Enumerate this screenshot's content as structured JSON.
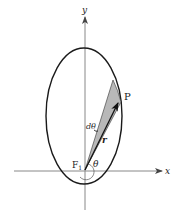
{
  "diagram": {
    "labels": {
      "y_axis": "y",
      "x_axis": "x",
      "point": "P",
      "focus": "F",
      "focus_subscript": "1",
      "angle": "θ",
      "dtheta": "dθ",
      "radius": "r"
    },
    "colors": {
      "axis": "#888888",
      "ellipse": "#1a1a1a",
      "wedge_fill": "#b8b8b8",
      "vector": "#111111"
    },
    "geometry": {
      "ellipse_center": [
        84,
        116
      ],
      "ellipse_rx": 38,
      "ellipse_ry": 68,
      "focus": [
        85,
        170
      ],
      "point_P": [
        119,
        102
      ],
      "wedge_far_point": [
        113,
        80
      ]
    }
  }
}
